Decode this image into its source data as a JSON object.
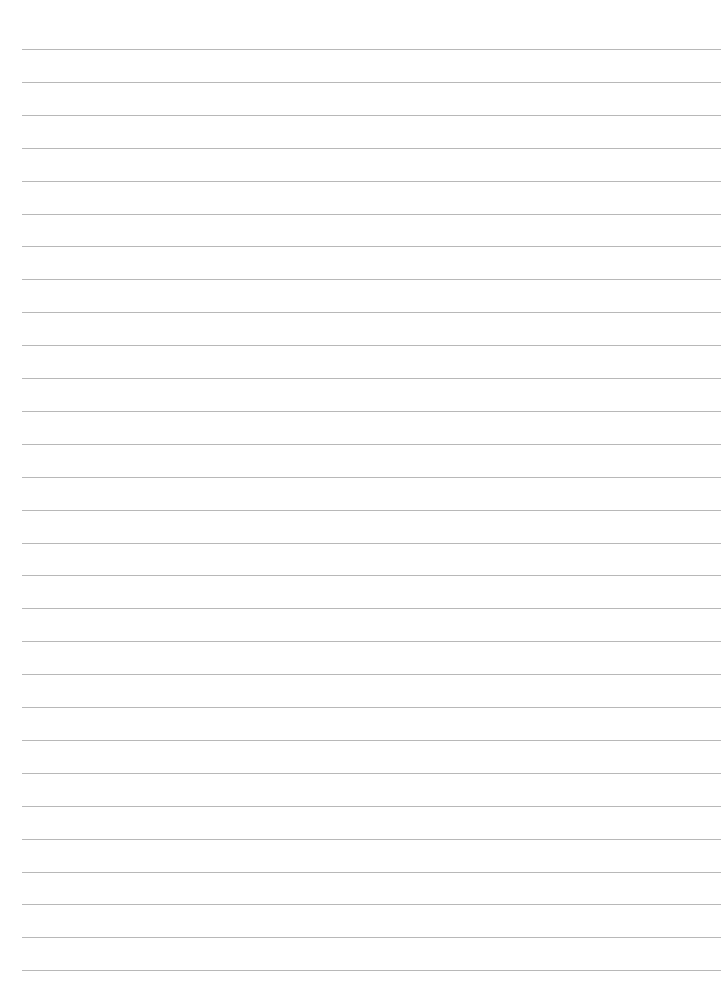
{
  "sheet": {
    "kind": "lined-paper",
    "background": "#ffffff",
    "rule_color": "#b8b8b8",
    "line_count": 29,
    "first_line_y": 49,
    "line_spacing": 32.9,
    "line_left": 22,
    "line_right": 721,
    "text": ""
  }
}
